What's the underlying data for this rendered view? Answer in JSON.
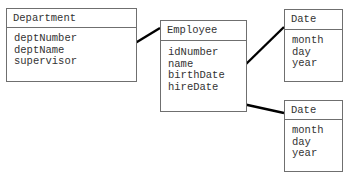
{
  "diagram": {
    "type": "UML class diagram (composition)",
    "classes": [
      {
        "id": "department",
        "name": "Department",
        "attributes": [
          "deptNumber",
          "deptName",
          "supervisor"
        ]
      },
      {
        "id": "employee",
        "name": "Employee",
        "attributes": [
          "idNumber",
          "name",
          "birthDate",
          "hireDate"
        ]
      },
      {
        "id": "date1",
        "name": "Date",
        "attributes": [
          "month",
          "day",
          "year"
        ]
      },
      {
        "id": "date2",
        "name": "Date",
        "attributes": [
          "month",
          "day",
          "year"
        ]
      }
    ],
    "relationships": [
      {
        "from": "Department.supervisor",
        "to": "Employee",
        "kind": "composition",
        "marker": "filled-diamond"
      },
      {
        "from": "Employee.birthDate",
        "to": "Date",
        "kind": "composition",
        "marker": "filled-diamond"
      },
      {
        "from": "Employee.hireDate",
        "to": "Date",
        "kind": "composition",
        "marker": "filled-diamond"
      }
    ],
    "colors": {
      "border": "#6f6f6f",
      "text": "#333333",
      "connector": "#000000"
    }
  }
}
